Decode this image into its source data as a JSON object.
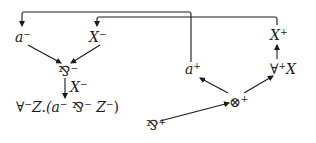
{
  "diagram": {
    "type": "proof-net",
    "colors": {
      "stroke": "#1a1a1a",
      "background": "#ffffff"
    },
    "nodes": {
      "a_minus": {
        "base": "a",
        "sup": "−"
      },
      "X_minus": {
        "base": "X",
        "sup": "−"
      },
      "par_minus": {
        "base": "⅋",
        "sup": "−"
      },
      "edge_X_minus": {
        "base": "X",
        "sup": "−"
      },
      "forall_minus": {
        "quant": "∀",
        "qsup": "−",
        "body": "Z.(a",
        "s1": "−",
        "op": " ⅋",
        "s2": "−",
        "z": " Z",
        "s3": "−",
        "close": ")"
      },
      "a_plus": {
        "base": "a",
        "sup": "+"
      },
      "X_plus": {
        "base": "X",
        "sup": "+"
      },
      "forall_plus": {
        "quant": "∀",
        "qsup": "+",
        "body": "X"
      },
      "tensor_plus": {
        "base": "⊗",
        "sup": "+"
      },
      "par_plus": {
        "base": "⅋",
        "sup": "+"
      }
    },
    "edges": [
      {
        "from": "a_plus",
        "to": "a_minus",
        "kind": "axiom-link"
      },
      {
        "from": "X_plus",
        "to": "X_minus",
        "kind": "axiom-link"
      },
      {
        "from": "a_minus",
        "to": "par_minus"
      },
      {
        "from": "X_minus",
        "to": "par_minus"
      },
      {
        "from": "par_minus",
        "to": "forall_minus",
        "label": "X⁻"
      },
      {
        "from": "tensor_plus",
        "to": "a_plus"
      },
      {
        "from": "tensor_plus",
        "to": "forall_plus"
      },
      {
        "from": "forall_plus",
        "to": "X_plus"
      },
      {
        "from": "par_plus",
        "to": "tensor_plus"
      }
    ]
  }
}
